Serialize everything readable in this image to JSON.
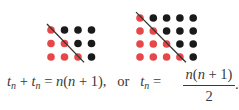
{
  "figure": {
    "grids": [
      {
        "n": 3,
        "rows": 3,
        "cols": 4,
        "origin_x": 51,
        "origin_y": 30,
        "spacing_x": 13.5,
        "spacing_y": 13.5
      },
      {
        "n": 4,
        "rows": 4,
        "cols": 5,
        "origin_x": 140,
        "origin_y": 18,
        "spacing_x": 13.3,
        "spacing_y": 13
      }
    ],
    "colors": {
      "red_dot": "#e8474a",
      "black_dot": "#1a1a1a",
      "line": "#333333"
    }
  },
  "equation": {
    "lhs_t1": "t",
    "lhs_sub1": "n",
    "plus": " + ",
    "lhs_t2": "t",
    "lhs_sub2": "n",
    "equals": " = ",
    "rhs": "n(n + 1),",
    "connector": "   or   ",
    "t3": "t",
    "sub3": "n",
    "equals2": " = ",
    "numerator": "n(n + 1)",
    "denominator": "2",
    "period": "."
  }
}
